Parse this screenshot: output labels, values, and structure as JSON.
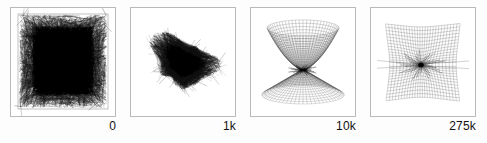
{
  "figure": {
    "background_color": "#ffffff",
    "frame_color": "#b9b9b9",
    "ink_color": "#111111",
    "panel_count": 4
  },
  "panels": [
    {
      "id": "panel-iteration-0",
      "caption": "0",
      "state_description": "dense tangled scribble filling a square region",
      "ink_density": "very high"
    },
    {
      "id": "panel-iteration-1k",
      "caption": "1k",
      "state_description": "contracted crumpled blob of folded mesh",
      "ink_density": "high"
    },
    {
      "id": "panel-iteration-10k",
      "caption": "10k",
      "state_description": "hourglass surface: upper bowl and lower cone meeting at a pinch point",
      "ink_density": "medium"
    },
    {
      "id": "panel-iteration-275k",
      "caption": "275k",
      "state_description": "flattened quad grid with a radial singularity near the center",
      "ink_density": "low"
    }
  ],
  "chart_data": {
    "type": "scatter",
    "xlabel": "",
    "ylabel": "",
    "categories": [
      "0",
      "1k",
      "10k",
      "275k"
    ],
    "values": [
      0,
      1000,
      10000,
      275000
    ],
    "series": [
      {
        "name": "training iterations",
        "values": [
          0,
          1000,
          10000,
          275000
        ]
      }
    ],
    "annotations": [
      "0",
      "1k",
      "10k",
      "275k"
    ],
    "legend": "none",
    "grid": false
  }
}
